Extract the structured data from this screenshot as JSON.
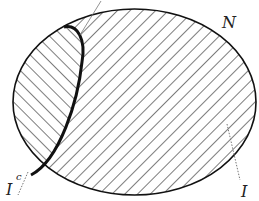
{
  "diagram": {
    "type": "set-region-diagram",
    "labels": {
      "outer_set": "N",
      "inner_region": "I",
      "complement_base": "I",
      "complement_superscript": "c"
    },
    "regions": [
      {
        "name": "N",
        "shape": "ellipse",
        "hatch": "backslash (\\) diagonal",
        "description": "outer set"
      },
      {
        "name": "I^c",
        "shape": "lens on left side of N",
        "hatch": "slash (/) diagonal",
        "border": "bold"
      },
      {
        "name": "I",
        "shape": "remainder of N",
        "hatch": "backslash (\\) diagonal"
      }
    ],
    "colors": {
      "stroke": "#111111",
      "hatch": "#444444",
      "pointer": "#777777",
      "background": "#ffffff"
    }
  }
}
